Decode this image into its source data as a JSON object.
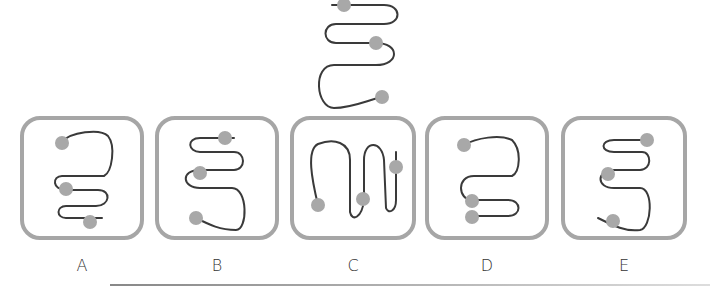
{
  "puzzle": {
    "reference": {
      "description": "S-shaped curve with three gray dots",
      "path": "M 332 5 L 384 5 C 402 5 402 24 384 24 L 336 24 C 322 24 322 43 336 43 L 376 43 C 400 43 400 65 376 65 L 334 65 C 312 65 316 108 334 108 C 352 108 368 100 382 97",
      "dots": [
        [
          344,
          5
        ],
        [
          376,
          43
        ],
        [
          382,
          97
        ]
      ]
    },
    "options": [
      {
        "label": "A",
        "box": {
          "x": 22,
          "y": 118,
          "w": 120,
          "h": 120
        },
        "path": "M 62 142 C 70 132 100 128 108 136 C 116 146 112 172 104 176 L 62 176 C 52 176 52 190 66 190 L 98 190 C 112 190 110 206 96 206 L 66 206 C 56 206 56 218 66 218 L 102 218",
        "dots": [
          [
            62,
            143
          ],
          [
            66,
            189
          ],
          [
            90,
            222
          ]
        ]
      },
      {
        "label": "B",
        "box": {
          "x": 157,
          "y": 118,
          "w": 120,
          "h": 120
        },
        "path": "M 234 138 L 200 138 C 186 138 188 152 200 152 L 234 152 C 246 152 246 170 234 170 L 200 170 C 180 170 182 188 200 188 L 232 188 C 248 188 248 230 236 230 C 220 230 210 225 196 218",
        "dots": [
          [
            225,
            138
          ],
          [
            200,
            173
          ],
          [
            196,
            218
          ]
        ]
      },
      {
        "label": "C",
        "box": {
          "x": 292,
          "y": 118,
          "w": 122,
          "h": 120
        },
        "path": "M 318 205 C 312 180 306 150 318 144 C 334 138 350 142 350 160 L 350 212 C 352 222 362 218 364 200 L 364 160 C 364 140 382 140 384 160 L 386 208 C 388 214 396 212 396 200 L 396 152",
        "dots": [
          [
            318,
            205
          ],
          [
            363,
            199
          ],
          [
            396,
            167
          ]
        ]
      },
      {
        "label": "D",
        "box": {
          "x": 427,
          "y": 118,
          "w": 120,
          "h": 120
        },
        "path": "M 464 145 C 476 138 500 134 512 140 C 522 150 520 172 512 176 L 474 176 C 456 176 458 200 472 200 L 508 200 C 522 200 522 216 508 216 L 472 216",
        "dots": [
          [
            464,
            145
          ],
          [
            472,
            201
          ],
          [
            472,
            217
          ]
        ]
      },
      {
        "label": "E",
        "box": {
          "x": 563,
          "y": 118,
          "w": 122,
          "h": 120
        },
        "path": "M 648 140 L 614 140 C 600 140 600 152 614 152 L 642 152 C 652 152 652 170 640 170 L 614 170 C 596 170 596 188 614 188 L 640 188 C 654 188 652 228 640 230 C 626 232 614 226 598 218",
        "dots": [
          [
            647,
            140
          ],
          [
            608,
            174
          ],
          [
            613,
            221
          ]
        ]
      }
    ],
    "colors": {
      "stroke": "#3a3a3a",
      "dot": "#a8a8a8",
      "box_border": "#a6a6a6",
      "label": "#333333"
    }
  }
}
